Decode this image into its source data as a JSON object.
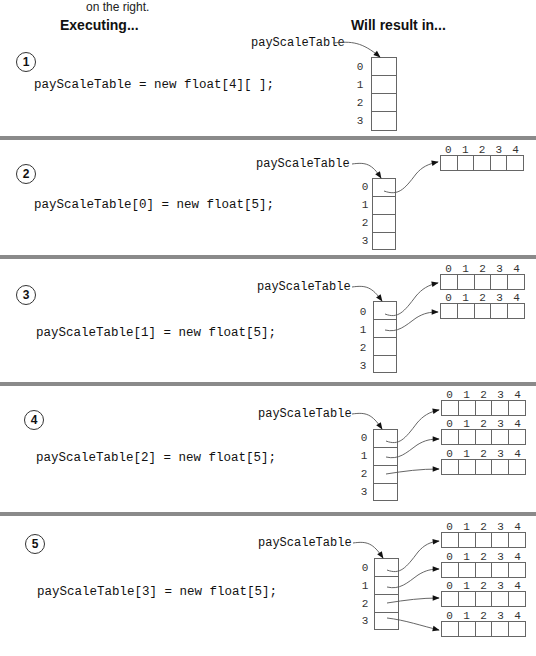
{
  "intro": {
    "text": "on the right."
  },
  "headers": {
    "left": "Executing...",
    "right": "Will result in..."
  },
  "variable_name": "payScaleTable",
  "outer_indices": [
    "0",
    "1",
    "2",
    "3"
  ],
  "inner_indices": [
    "0",
    "1",
    "2",
    "3",
    "4"
  ],
  "steps": [
    {
      "number": "1",
      "code": "payScaleTable = new float[4][ ];",
      "allocated_rows": []
    },
    {
      "number": "2",
      "code": "payScaleTable[0] = new float[5];",
      "allocated_rows": [
        0
      ]
    },
    {
      "number": "3",
      "code": "payScaleTable[1] = new float[5];",
      "allocated_rows": [
        0,
        1
      ]
    },
    {
      "number": "4",
      "code": "payScaleTable[2] = new float[5];",
      "allocated_rows": [
        0,
        1,
        2
      ]
    },
    {
      "number": "5",
      "code": "payScaleTable[3] = new float[5];",
      "allocated_rows": [
        0,
        1,
        2,
        3
      ]
    }
  ],
  "colors": {
    "separator": "#8a8a8a",
    "line": "#666666",
    "arrow": "#111111"
  }
}
